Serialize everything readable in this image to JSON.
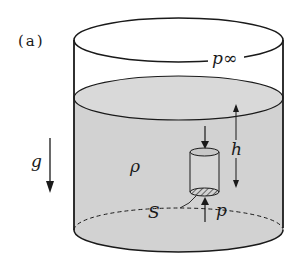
{
  "figure": {
    "panel_label": "(a)",
    "labels": {
      "gravity": "g",
      "density": "ρ",
      "height": "h",
      "area": "S",
      "pressure_top": "p∞",
      "pressure_bottom": "p"
    },
    "colors": {
      "liquid": "#cfcfcf",
      "stroke": "#1a1a1a",
      "background": "#ffffff"
    }
  }
}
